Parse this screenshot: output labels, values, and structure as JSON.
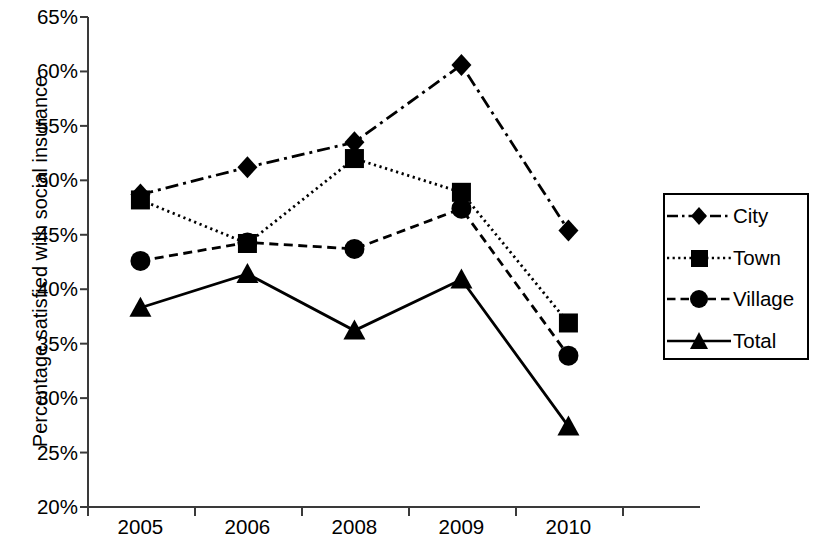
{
  "chart_data": {
    "type": "line",
    "title": "",
    "xlabel": "",
    "ylabel": "Percentage satisfied with social insurance",
    "categories": [
      "2005",
      "2006",
      "2008",
      "2009",
      "2010"
    ],
    "x_tick_labels": [
      "2005",
      "2006",
      "2008",
      "2009",
      "2010"
    ],
    "y_tick_labels": [
      "65%",
      "60%",
      "55%",
      "50%",
      "45%",
      "40%",
      "35%",
      "30%",
      "25%",
      "20%"
    ],
    "y_tick_values": [
      65,
      60,
      55,
      50,
      45,
      40,
      35,
      30,
      25,
      20
    ],
    "ylim": [
      20,
      65
    ],
    "y_unit": "%",
    "grid": false,
    "legend_position": "right",
    "series": [
      {
        "name": "City",
        "marker": "diamond",
        "line_style": "dash-dot",
        "color": "#000000",
        "values": [
          48.7,
          51.2,
          53.5,
          60.6,
          45.4
        ]
      },
      {
        "name": "Town",
        "marker": "square",
        "line_style": "dotted",
        "color": "#000000",
        "values": [
          48.2,
          44.2,
          52.0,
          48.9,
          36.9
        ]
      },
      {
        "name": "Village",
        "marker": "circle",
        "line_style": "dashed",
        "color": "#000000",
        "values": [
          42.6,
          44.3,
          43.7,
          47.4,
          33.9
        ]
      },
      {
        "name": "Total",
        "marker": "triangle",
        "line_style": "solid",
        "color": "#000000",
        "values": [
          38.3,
          41.4,
          36.2,
          40.9,
          27.4
        ]
      }
    ]
  },
  "legend": {
    "entries": [
      {
        "label": "City"
      },
      {
        "label": "Town"
      },
      {
        "label": "Village"
      },
      {
        "label": "Total"
      }
    ]
  }
}
